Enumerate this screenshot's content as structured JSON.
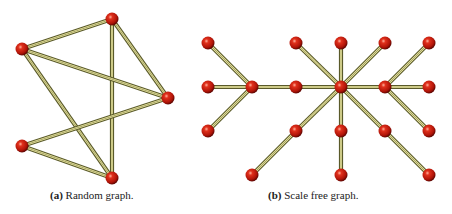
{
  "colors": {
    "edge_outer": "#5a5a2a",
    "edge_inner": "#f4f0a8",
    "node_fill": "#c81d10",
    "node_dark": "#7a0a04",
    "node_highlight": "#ff9a80"
  },
  "panels": [
    {
      "id": "a",
      "label": "(a)",
      "caption": "Random graph.",
      "nodes": [
        {
          "id": "a1",
          "x": 112,
          "y": 19
        },
        {
          "id": "a2",
          "x": 22,
          "y": 49
        },
        {
          "id": "a3",
          "x": 168,
          "y": 98
        },
        {
          "id": "a4",
          "x": 22,
          "y": 146
        },
        {
          "id": "a5",
          "x": 112,
          "y": 178
        }
      ],
      "edges": [
        [
          "a1",
          "a2"
        ],
        [
          "a1",
          "a3"
        ],
        [
          "a1",
          "a5"
        ],
        [
          "a2",
          "a3"
        ],
        [
          "a2",
          "a5"
        ],
        [
          "a4",
          "a3"
        ],
        [
          "a4",
          "a5"
        ]
      ]
    },
    {
      "id": "b",
      "label": "(b)",
      "caption": "Scale free graph.",
      "nodes": [
        {
          "id": "b1",
          "x": 208,
          "y": 43
        },
        {
          "id": "b2",
          "x": 296,
          "y": 43
        },
        {
          "id": "b3",
          "x": 341,
          "y": 43
        },
        {
          "id": "b4",
          "x": 385,
          "y": 43
        },
        {
          "id": "b5",
          "x": 429,
          "y": 43
        },
        {
          "id": "b6",
          "x": 208,
          "y": 87
        },
        {
          "id": "b7",
          "x": 252,
          "y": 87
        },
        {
          "id": "b8",
          "x": 296,
          "y": 87
        },
        {
          "id": "b9",
          "x": 341,
          "y": 87
        },
        {
          "id": "b10",
          "x": 385,
          "y": 87
        },
        {
          "id": "b11",
          "x": 429,
          "y": 87
        },
        {
          "id": "b12",
          "x": 208,
          "y": 131
        },
        {
          "id": "b13",
          "x": 296,
          "y": 131
        },
        {
          "id": "b14",
          "x": 341,
          "y": 131
        },
        {
          "id": "b15",
          "x": 385,
          "y": 131
        },
        {
          "id": "b16",
          "x": 429,
          "y": 131
        },
        {
          "id": "b17",
          "x": 252,
          "y": 175
        },
        {
          "id": "b18",
          "x": 341,
          "y": 175
        },
        {
          "id": "b19",
          "x": 429,
          "y": 175
        }
      ],
      "edges": [
        [
          "b7",
          "b1"
        ],
        [
          "b7",
          "b6"
        ],
        [
          "b7",
          "b12"
        ],
        [
          "b7",
          "b8"
        ],
        [
          "b8",
          "b9"
        ],
        [
          "b9",
          "b2"
        ],
        [
          "b9",
          "b3"
        ],
        [
          "b9",
          "b4"
        ],
        [
          "b9",
          "b10"
        ],
        [
          "b9",
          "b13"
        ],
        [
          "b9",
          "b14"
        ],
        [
          "b9",
          "b15"
        ],
        [
          "b13",
          "b17"
        ],
        [
          "b14",
          "b18"
        ],
        [
          "b15",
          "b19"
        ],
        [
          "b10",
          "b5"
        ],
        [
          "b10",
          "b11"
        ],
        [
          "b10",
          "b16"
        ]
      ]
    }
  ]
}
